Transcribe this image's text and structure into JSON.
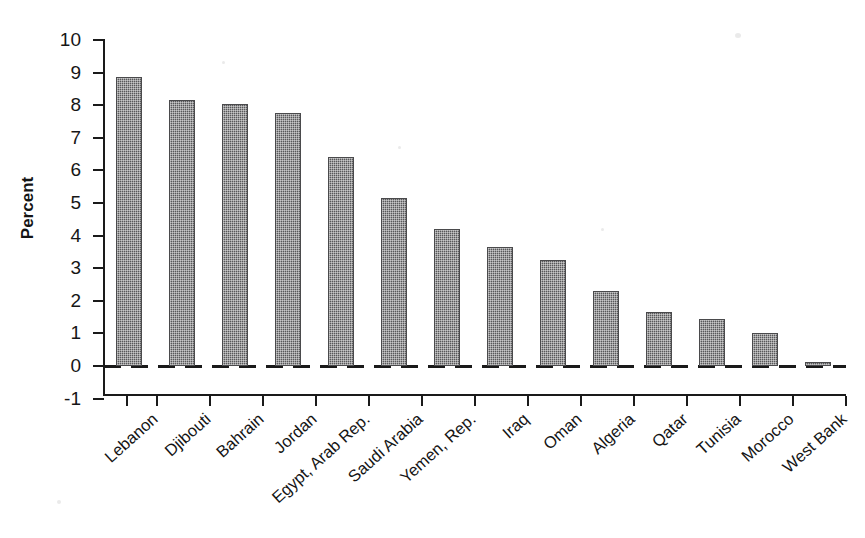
{
  "chart_data": {
    "type": "bar",
    "title": "",
    "xlabel": "",
    "ylabel": "Percent",
    "ylim": [
      -1,
      10
    ],
    "ytick_labels": [
      "10",
      "9",
      "8",
      "7",
      "6",
      "5",
      "4",
      "3",
      "2",
      "1",
      "0",
      "-1"
    ],
    "yticks": [
      10,
      9,
      8,
      7,
      6,
      5,
      4,
      3,
      2,
      1,
      0,
      -1
    ],
    "grid": false,
    "legend": null,
    "zero_reference_line": true,
    "categories": [
      "Lebanon",
      "Djibouti",
      "Bahrain",
      "Jordan",
      "Egypt, Arab Rep.",
      "Saudi Arabia",
      "Yemen, Rep.",
      "Iraq",
      "Oman",
      "Algeria",
      "Qatar",
      "Tunisia",
      "Morocco",
      "West Bank"
    ],
    "values": [
      8.85,
      8.15,
      8.05,
      7.75,
      6.4,
      5.15,
      4.2,
      3.65,
      3.25,
      2.3,
      1.65,
      1.45,
      1.0,
      0.05
    ],
    "bar_color": "#58585a"
  }
}
